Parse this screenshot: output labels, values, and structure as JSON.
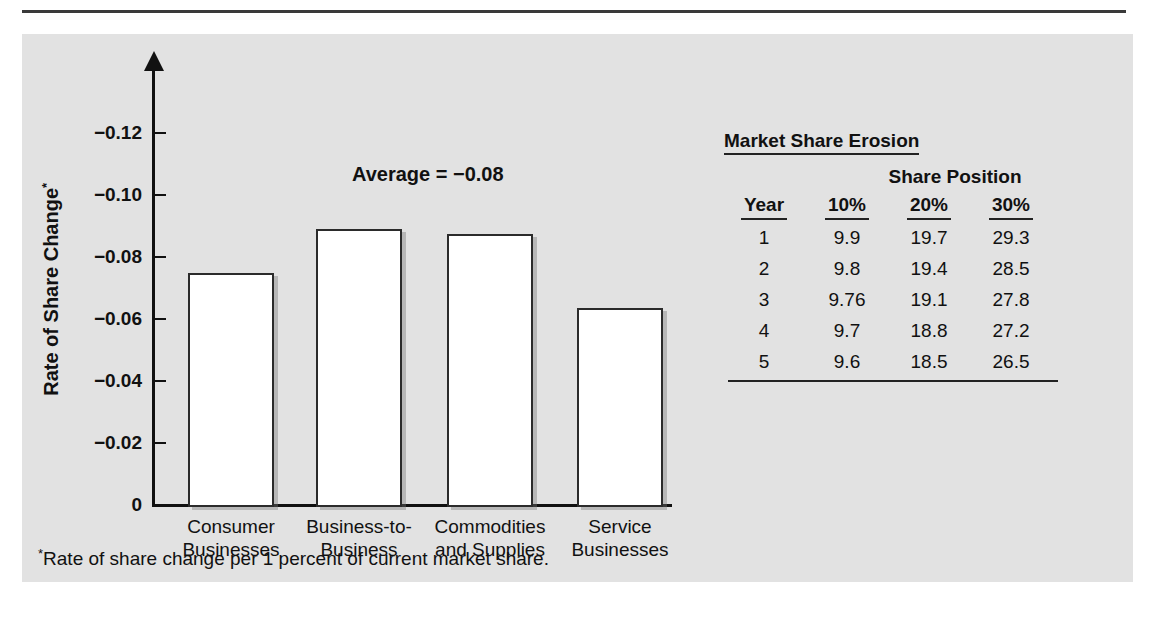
{
  "figure": {
    "heading": "FIGURE 13-6  MARKET SHARE EROSION",
    "panel_bg": "#e2e2e2"
  },
  "chart_data": {
    "type": "bar",
    "title": "",
    "xlabel": "",
    "ylabel": "Rate of Share Change*",
    "ylim": [
      0,
      -0.13
    ],
    "grid": false,
    "legend": "none",
    "categories": [
      "Consumer Businesses",
      "Business-to-Business",
      "Commodities and Supplies",
      "Service Businesses"
    ],
    "values": [
      -0.075,
      -0.089,
      -0.0875,
      -0.0635
    ],
    "ytick_labels": [
      "−0.12",
      "−0.10",
      "−0.08",
      "−0.06",
      "−0.04",
      "−0.02",
      "0"
    ],
    "ytick_values": [
      -0.12,
      -0.1,
      -0.08,
      -0.06,
      -0.04,
      -0.02,
      0
    ],
    "annotations": [
      "Average = −0.08"
    ],
    "footnote": "Rate of share change per 1 percent of current market share."
  },
  "axis": {
    "y_title_main": "Rate of Share Change",
    "y_title_sup": "*"
  },
  "categories_display": [
    {
      "line1": "Consumer",
      "line2": "Businesses"
    },
    {
      "line1": "Business-to-",
      "line2": "Business"
    },
    {
      "line1": "Commodities",
      "line2": "and Supplies"
    },
    {
      "line1": "Service",
      "line2": "Businesses"
    }
  ],
  "annotation": {
    "average_label": "Average = −0.08"
  },
  "footnote": {
    "marker": "*",
    "text": "Rate of share change per 1 percent of current market share."
  },
  "side_table": {
    "title": "Market Share Erosion",
    "subtitle": "Share Position",
    "headers": [
      "Year",
      "10%",
      "20%",
      "30%"
    ],
    "rows": [
      {
        "year": "1",
        "p10": "9.9",
        "p20": "19.7",
        "p30": "29.3"
      },
      {
        "year": "2",
        "p10": "9.8",
        "p20": "19.4",
        "p30": "28.5"
      },
      {
        "year": "3",
        "p10": "9.76",
        "p20": "19.1",
        "p30": "27.8"
      },
      {
        "year": "4",
        "p10": "9.7",
        "p20": "18.8",
        "p30": "27.2"
      },
      {
        "year": "5",
        "p10": "9.6",
        "p20": "18.5",
        "p30": "26.5"
      }
    ]
  }
}
